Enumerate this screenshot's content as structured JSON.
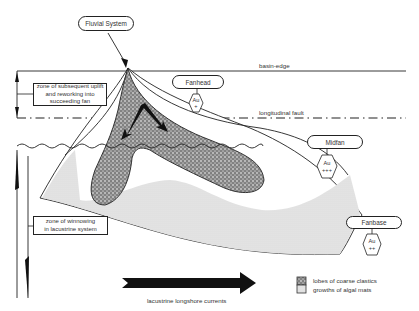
{
  "labels": {
    "fluvial_system": "Fluvial System",
    "basin_edge": "basin-edge",
    "longitudinal_fault": "longitudinal fault",
    "fanhead": "Fanhead",
    "midfan": "Midfan",
    "fanbase": "Fanbase",
    "zone_uplift": [
      "zone of subsequent uplift",
      "and reworking into",
      "succeeding fan"
    ],
    "zone_winnowing": [
      "zone of winnowing",
      "in lacustrine system"
    ],
    "longshore_currents": "lacustrine longshore currents"
  },
  "gold_grades": {
    "fanhead": {
      "element": "Au",
      "grade": "+"
    },
    "midfan": {
      "element": "Au",
      "grade": "+++"
    },
    "fanbase": {
      "element": "Au",
      "grade": "++"
    }
  },
  "legend": [
    {
      "pattern": "coarse-stipple",
      "label": "lobes of coarse clastics"
    },
    {
      "pattern": "fine-stipple",
      "label": "growths of algal mats"
    }
  ],
  "colors": {
    "line": "#222222",
    "coarse_clastics": "#6e6e6e",
    "algal_mats": "#e2e2e2",
    "arrow": "#111111"
  }
}
